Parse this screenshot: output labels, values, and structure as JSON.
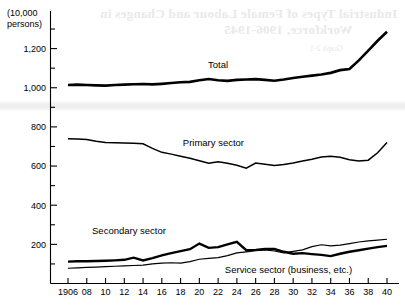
{
  "chart_data": {
    "type": "line",
    "title": "",
    "xlabel": "",
    "ylabel": "",
    "unit_label": "(10,000 persons)",
    "unit_label_line1": "(10,000",
    "unit_label_line2": "persons)",
    "grid": false,
    "legend_position": "inline-annotations",
    "xlim": [
      1906,
      1940
    ],
    "ylim": [
      0,
      1300
    ],
    "yticks": [
      200,
      400,
      600,
      800,
      1000,
      1200
    ],
    "ytick_labels": [
      "200",
      "400",
      "600",
      "800",
      "1,000",
      "1,200"
    ],
    "yminor_step": 100,
    "x": [
      1906,
      1907,
      1908,
      1909,
      1910,
      1911,
      1912,
      1913,
      1914,
      1915,
      1916,
      1917,
      1918,
      1919,
      1920,
      1921,
      1922,
      1923,
      1924,
      1925,
      1926,
      1927,
      1928,
      1929,
      1930,
      1931,
      1932,
      1933,
      1934,
      1935,
      1936,
      1937,
      1938,
      1939,
      1940
    ],
    "xtick_labels": [
      "1906",
      "08",
      "10",
      "12",
      "14",
      "16",
      "18",
      "20",
      "22",
      "24",
      "26",
      "28",
      "30",
      "32",
      "34",
      "36",
      "38",
      "40"
    ],
    "xtick_values": [
      1906,
      1908,
      1910,
      1912,
      1914,
      1916,
      1918,
      1920,
      1922,
      1924,
      1926,
      1928,
      1930,
      1932,
      1934,
      1936,
      1938,
      1940
    ],
    "series": [
      {
        "name": "Total",
        "label": "Total",
        "color": "#000000",
        "stroke_width": 2.6,
        "values": [
          1014,
          1016,
          1014,
          1012,
          1011,
          1014,
          1016,
          1018,
          1019,
          1017,
          1020,
          1024,
          1028,
          1030,
          1038,
          1045,
          1038,
          1035,
          1040,
          1042,
          1044,
          1040,
          1036,
          1042,
          1050,
          1056,
          1062,
          1068,
          1076,
          1090,
          1096,
          1140,
          1190,
          1240,
          1286
        ]
      },
      {
        "name": "Primary sector",
        "label": "Primary sector",
        "color": "#000000",
        "stroke_width": 1.5,
        "values": [
          740,
          738,
          736,
          727,
          720,
          719,
          718,
          716,
          714,
          690,
          670,
          661,
          650,
          640,
          627,
          614,
          622,
          614,
          604,
          589,
          615,
          609,
          603,
          608,
          616,
          626,
          635,
          646,
          650,
          645,
          632,
          626,
          630,
          668,
          720
        ]
      },
      {
        "name": "Secondary sector",
        "label": "Secondary sector",
        "color": "#000000",
        "stroke_width": 2.4,
        "values": [
          112,
          114,
          114,
          115,
          116,
          118,
          121,
          132,
          118,
          130,
          144,
          155,
          165,
          175,
          204,
          182,
          186,
          200,
          213,
          170,
          172,
          176,
          176,
          162,
          152,
          155,
          150,
          146,
          140,
          152,
          162,
          170,
          178,
          186,
          192
        ]
      },
      {
        "name": "Service sector (business, etc.)",
        "label": "Service sector (business, etc.)",
        "color": "#000000",
        "stroke_width": 1.2,
        "values": [
          78,
          80,
          82,
          84,
          86,
          88,
          90,
          92,
          94,
          100,
          104,
          106,
          104,
          112,
          124,
          128,
          132,
          142,
          156,
          162,
          168,
          172,
          166,
          156,
          164,
          172,
          188,
          198,
          192,
          196,
          204,
          212,
          218,
          222,
          226
        ]
      }
    ]
  },
  "annotations": {
    "total": {
      "label": "Total",
      "x": 1922,
      "y": 1100
    },
    "primary": {
      "label": "Primary sector",
      "x": 1921.5,
      "y": 700
    },
    "secondary": {
      "label": "Secondary sector",
      "x": 1912.5,
      "y": 252
    },
    "service": {
      "label": "Service sector (business, etc.)",
      "x": 1929.5,
      "y": 55
    }
  },
  "bleed_through": {
    "line1": "Industrial Types of Female Labour and Changes in",
    "line2": "Workforce, 1906-1945",
    "line3": "Graph 2-1"
  }
}
